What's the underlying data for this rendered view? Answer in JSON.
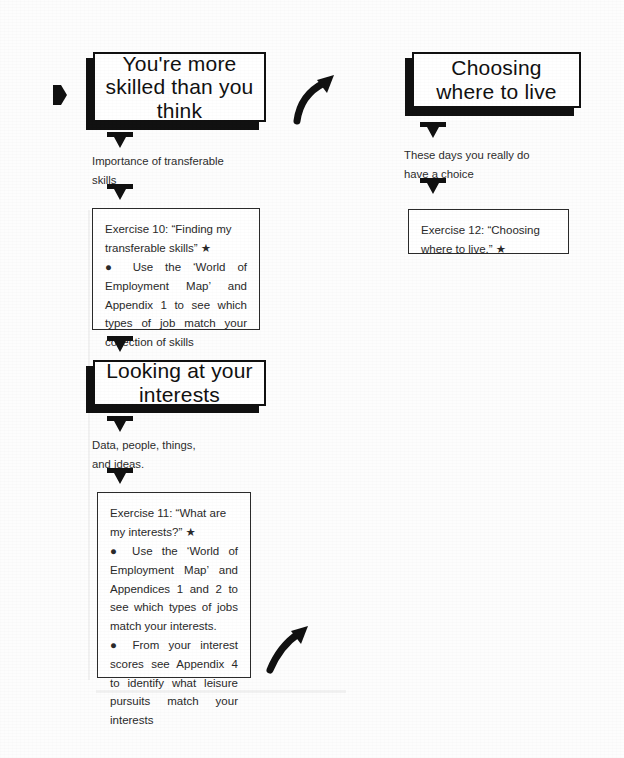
{
  "page": {
    "background_color": "#fdfdfd",
    "ink_color": "#111111",
    "width": 624,
    "height": 758
  },
  "flow": {
    "left_column": {
      "header_1": {
        "title": "You're more\nskilled than you\nthink",
        "note": "Importance of transferable\nskills",
        "exercise": {
          "heading": "Exercise 10: “Finding my transferable skills” ★",
          "bullets": [
            "● Use the ‘World of Employment Map’ and Appendix 1 to see which types of job match your collection of skills"
          ]
        }
      },
      "header_2": {
        "title": "Looking at your\ninterests",
        "note": "Data, people, things,\nand ideas.",
        "exercise": {
          "heading": "Exercise 11: “What are my interests?” ★",
          "bullets": [
            "● Use the ‘World of Employment Map’ and Appendices 1 and 2 to see which types of jobs match your interests.",
            "● From your interest scores see Appendix 4 to identify what leisure pursuits match your interests"
          ]
        }
      }
    },
    "right_column": {
      "header_1": {
        "title": "Choosing\nwhere to live",
        "note": "These days you really do\nhave a choice",
        "exercise": {
          "heading": "Exercise 12: “Choosing where to live.” ★",
          "bullets": []
        }
      }
    },
    "connectors": {
      "entry_arrow": "right-arrowhead-icon",
      "down_arrows": [
        "down-arrow-skills-note",
        "down-arrow-exercise-10",
        "down-arrow-interests-header",
        "down-arrow-interests-note",
        "down-arrow-exercise-11",
        "down-arrow-live-note"
      ],
      "curved_arrows": [
        "curved-arrow-top-right",
        "curved-arrow-bottom-right"
      ]
    }
  }
}
